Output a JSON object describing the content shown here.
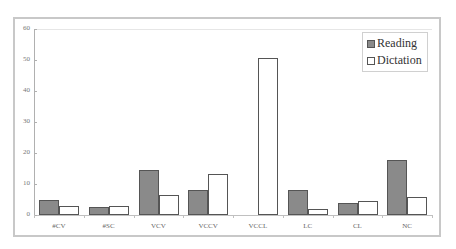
{
  "chart_data": {
    "type": "bar",
    "title": "",
    "xlabel": "",
    "ylabel": "",
    "ylim": [
      0,
      60
    ],
    "yticks": [
      0,
      10,
      20,
      30,
      40,
      50,
      60
    ],
    "grid": false,
    "legend_position": "top-right",
    "categories": [
      "#CV",
      "#SC",
      "VCV",
      "VCCV",
      "VCCL",
      "LC",
      "CL",
      "NC"
    ],
    "series": [
      {
        "name": "Reading",
        "color": "#8a8a8a",
        "values": [
          5,
          2.7,
          14.5,
          8.2,
          0,
          8.2,
          3.8,
          17.8
        ]
      },
      {
        "name": "Dictation",
        "color": "#ffffff",
        "values": [
          2.9,
          2.9,
          6.5,
          13.1,
          50.5,
          1.8,
          4.6,
          5.7
        ]
      }
    ]
  },
  "legend": {
    "reading": "Reading",
    "dictation": "Dictation"
  },
  "yaxis": {
    "labels": [
      "0",
      "10",
      "20",
      "30",
      "40",
      "50",
      "60"
    ]
  },
  "xaxis": {
    "labels": [
      "#CV",
      "#SC",
      "VCV",
      "VCCV",
      "VCCL",
      "LC",
      "CL",
      "NC"
    ]
  }
}
